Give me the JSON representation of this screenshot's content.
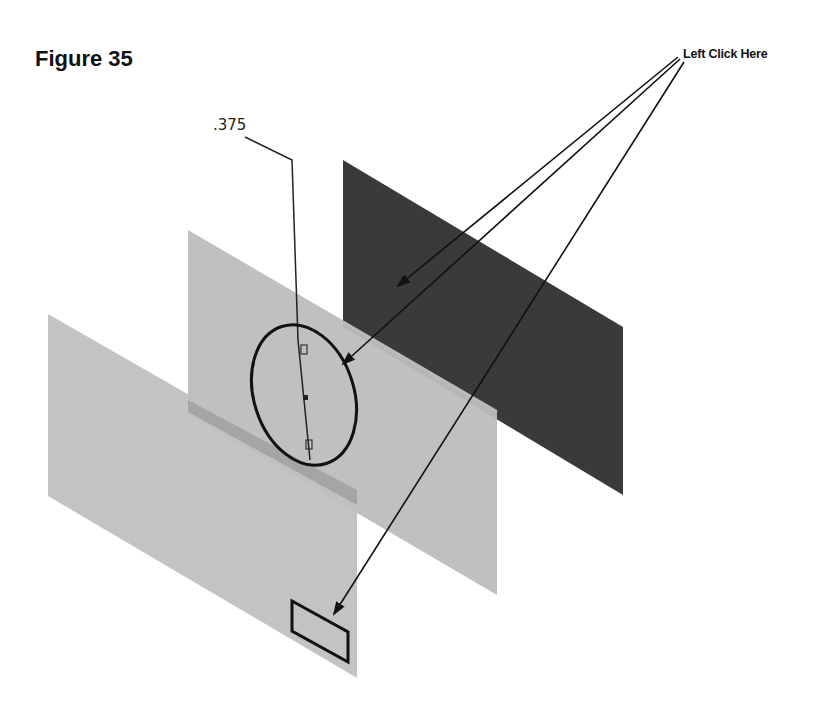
{
  "figure": {
    "title": "Figure 35",
    "callout_label": "Left Click Here",
    "dimension_label": ".375"
  },
  "planes": [
    {
      "name": "front-plane",
      "color": "#bdbdbd"
    },
    {
      "name": "right-plane",
      "color": "#bcbcbc"
    },
    {
      "name": "top-plane",
      "color": "#3a3a3a"
    }
  ],
  "sketch": {
    "circle": "ellipse sketch on right plane",
    "rectangle": "rectangle sketch on front plane"
  },
  "callout_targets": [
    "top-plane",
    "circle-sketch",
    "rectangle-sketch"
  ]
}
